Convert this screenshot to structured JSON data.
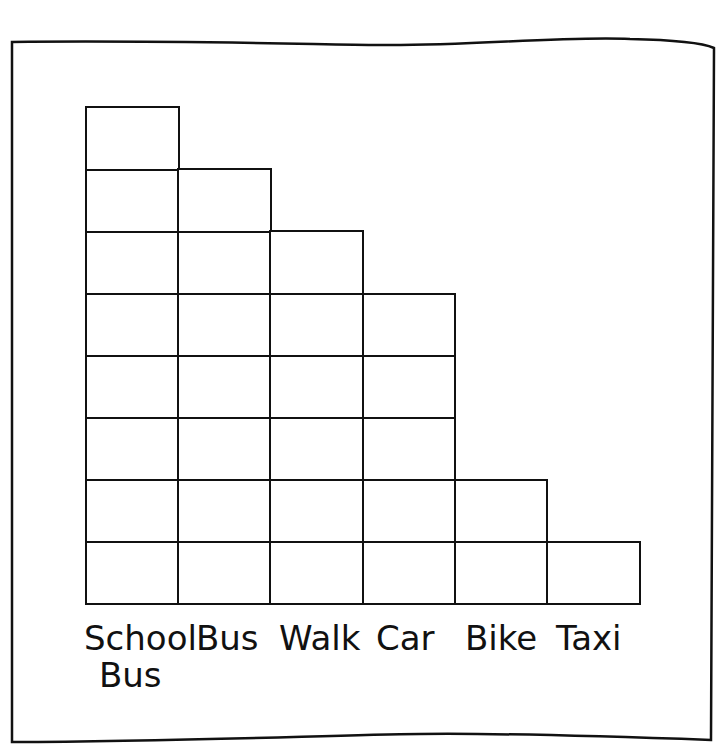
{
  "chart_data": {
    "type": "bar",
    "title": "",
    "xlabel": "",
    "ylabel": "",
    "categories": [
      "School Bus",
      "Bus",
      "Walk",
      "Car",
      "Bike",
      "Taxi"
    ],
    "values": [
      8,
      7,
      6,
      5,
      2,
      1
    ],
    "ylim": [
      0,
      8
    ],
    "grid": true,
    "style": "unit-square pictograph bar chart (each square = 1)"
  },
  "labels": {
    "school_bus_line1": "School",
    "school_bus_line2": "Bus",
    "bus": "Bus",
    "walk": "Walk",
    "car": "Car",
    "bike": "Bike",
    "taxi": "Taxi"
  }
}
